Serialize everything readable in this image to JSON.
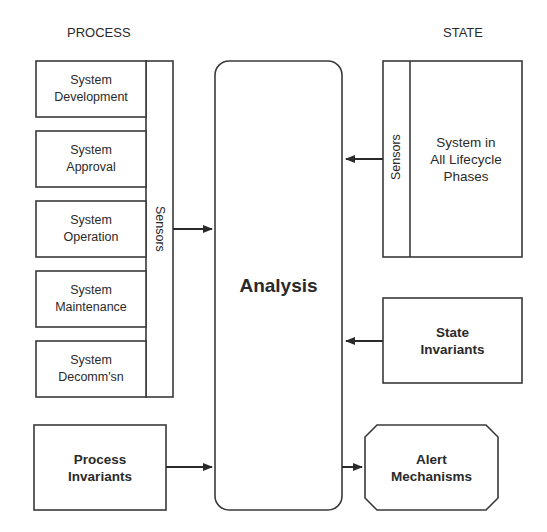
{
  "headers": {
    "process": "PROCESS",
    "state": "STATE"
  },
  "process_boxes": [
    {
      "label": "System\nDevelopment"
    },
    {
      "label": "System\nApproval"
    },
    {
      "label": "System\nOperation"
    },
    {
      "label": "System\nMaintenance"
    },
    {
      "label": "System\nDecomm'sn"
    }
  ],
  "process_sensors": "Sensors",
  "process_invariants": "Process\nInvariants",
  "analysis": "Analysis",
  "state_system": "System in\nAll Lifecycle\nPhases",
  "state_sensors": "Sensors",
  "state_invariants": "State\nInvariants",
  "alert_mechanisms": "Alert\nMechanisms",
  "colors": {
    "stroke": "#3a3a3a",
    "text": "#2a2a2a",
    "background": "#ffffff"
  }
}
